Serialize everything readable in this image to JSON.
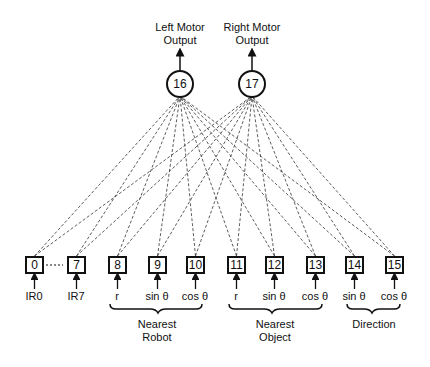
{
  "outputs": [
    {
      "id": "16",
      "label_line1": "Left Motor",
      "label_line2": "Output",
      "cx": 180
    },
    {
      "id": "17",
      "label_line1": "Right Motor",
      "label_line2": "Output",
      "cx": 252
    }
  ],
  "inputs": [
    {
      "id": "0",
      "x": 25,
      "label": "IR0"
    },
    {
      "id": "7",
      "x": 67,
      "label": "IR7"
    },
    {
      "id": "8",
      "x": 108,
      "label": "r"
    },
    {
      "id": "9",
      "x": 148,
      "label": "sin θ"
    },
    {
      "id": "10",
      "x": 186,
      "label": "cos θ"
    },
    {
      "id": "11",
      "x": 227,
      "label": "r"
    },
    {
      "id": "12",
      "x": 265,
      "label": "sin θ"
    },
    {
      "id": "13",
      "x": 306,
      "label": "cos θ"
    },
    {
      "id": "14",
      "x": 345,
      "label": "sin θ"
    },
    {
      "id": "15",
      "x": 385,
      "label": "cos θ"
    }
  ],
  "groups": [
    {
      "line1": "Nearest",
      "line2": "Robot"
    },
    {
      "line1": "Nearest",
      "line2": "Object"
    },
    {
      "line1": "Direction",
      "line2": ""
    }
  ],
  "ellipsis": "···"
}
